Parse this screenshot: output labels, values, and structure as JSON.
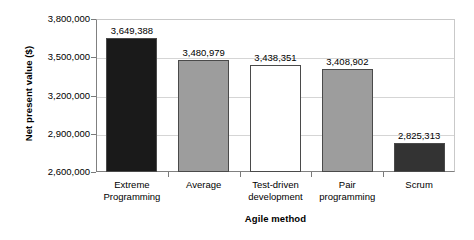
{
  "chart_data": {
    "type": "bar",
    "title": "",
    "xlabel": "Agile method",
    "ylabel": "Net present value ($)",
    "categories": [
      "Extreme\nProgramming",
      "Average",
      "Test-driven\ndevelopment",
      "Pair\nprogramming",
      "Scrum"
    ],
    "values": [
      3649388,
      3480979,
      3438351,
      3408902,
      2825313
    ],
    "value_labels": [
      "3,649,388",
      "3,480,979",
      "3,438,351",
      "3,408,902",
      "2,825,313"
    ],
    "bar_colors": [
      "#1a1a1a",
      "#9d9d9d",
      "#ffffff",
      "#9d9d9d",
      "#333333"
    ],
    "bar_border_color": "#4a4a4a",
    "ylim": [
      2600000,
      3800000
    ],
    "ytick_values": [
      2600000,
      2900000,
      3200000,
      3500000,
      3800000
    ],
    "ytick_labels": [
      "2,600,000",
      "2,900,000",
      "3,200,000",
      "3,500,000",
      "3,800,000"
    ],
    "grid": true,
    "legend": "none"
  }
}
